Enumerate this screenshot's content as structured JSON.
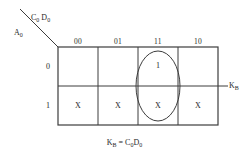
{
  "diagram": {
    "type": "karnaugh-map",
    "axis": {
      "column_variable_base": "C",
      "column_variable_base2": "D",
      "column_variable_sub": "0",
      "column_label_text": "C0 D0",
      "row_variable_base": "A",
      "row_variable_sub": "0",
      "row_label_text": "A0"
    },
    "column_headers": [
      "00",
      "01",
      "11",
      "10"
    ],
    "row_headers": [
      "0",
      "1"
    ],
    "cells": [
      {
        "row": "0",
        "col": "00",
        "value": ""
      },
      {
        "row": "0",
        "col": "01",
        "value": ""
      },
      {
        "row": "0",
        "col": "11",
        "value": "1"
      },
      {
        "row": "0",
        "col": "10",
        "value": ""
      },
      {
        "row": "1",
        "col": "00",
        "value": "X"
      },
      {
        "row": "1",
        "col": "01",
        "value": "X"
      },
      {
        "row": "1",
        "col": "11",
        "value": "X"
      },
      {
        "row": "1",
        "col": "10",
        "value": "X"
      }
    ],
    "grouping": {
      "shape": "ellipse",
      "covers_column": "11",
      "covers_rows": [
        "0",
        "1"
      ]
    },
    "output_label": {
      "base": "K",
      "sub": "B"
    },
    "caption": {
      "lhs_base": "K",
      "lhs_sub": "B",
      "equals": "=",
      "rhs_first_base": "C",
      "rhs_first_sub": "0",
      "rhs_second_base": "D",
      "rhs_second_sub": "0"
    },
    "colors": {
      "line": "#3c3c3c",
      "text": "#2a2a2a",
      "background": "#ffffff"
    }
  }
}
